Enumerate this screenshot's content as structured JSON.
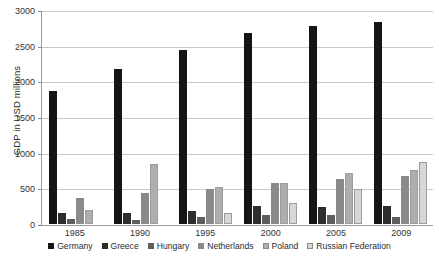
{
  "chart_data": {
    "type": "bar",
    "title": "",
    "xlabel": "",
    "ylabel": "GDP in USD millions",
    "categories": [
      "1985",
      "1990",
      "1995",
      "2000",
      "2005",
      "2009"
    ],
    "ylim": [
      0,
      3000
    ],
    "ytick_labels": [
      "0",
      "500",
      "1000",
      "1500",
      "2000",
      "2500",
      "3000"
    ],
    "ytick_values": [
      0,
      500,
      1000,
      1500,
      2000,
      2500,
      3000
    ],
    "grid": true,
    "legend_position": "bottom",
    "series": [
      {
        "name": "Germany",
        "color": "#151515",
        "values": [
          1870,
          2190,
          2450,
          2690,
          2790,
          2850
        ]
      },
      {
        "name": "Greece",
        "color": "#2e2e2e",
        "values": [
          150,
          160,
          190,
          260,
          240,
          250
        ]
      },
      {
        "name": "Hungary",
        "color": "#5e5e5e",
        "values": [
          70,
          60,
          100,
          120,
          130,
          100
        ]
      },
      {
        "name": "Netherlands",
        "color": "#8a8a8a",
        "values": [
          370,
          430,
          500,
          580,
          640,
          670
        ]
      },
      {
        "name": "Poland",
        "color": "#aeaeae",
        "values": [
          200,
          850,
          520,
          580,
          720,
          760
        ]
      },
      {
        "name": "Russian Federation",
        "color": "#d7d7d7",
        "values": [
          0,
          0,
          150,
          300,
          500,
          870
        ]
      }
    ]
  },
  "axis": {
    "y_title": "GDP in USD millions"
  },
  "legend": {
    "entries": [
      {
        "label": "Germany",
        "color": "#151515"
      },
      {
        "label": "Greece",
        "color": "#2e2e2e"
      },
      {
        "label": "Hungary",
        "color": "#5e5e5e"
      },
      {
        "label": "Netherlands",
        "color": "#8a8a8a"
      },
      {
        "label": "Poland",
        "color": "#aeaeae"
      },
      {
        "label": "Russian Federation",
        "color": "#d7d7d7"
      }
    ]
  }
}
